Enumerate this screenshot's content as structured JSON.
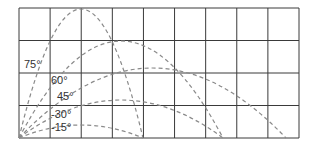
{
  "diagram": {
    "grid": {
      "x0": 19,
      "y0": 8,
      "x1": 299,
      "y1": 138,
      "cols": 9,
      "rows": 4,
      "color": "#3a3a3a"
    },
    "origin": {
      "x": 19,
      "y": 138
    },
    "trajectory_color": "#8a8a8a",
    "trajectories": [
      {
        "angle": "75°",
        "land_x": 143,
        "peak_y": 9
      },
      {
        "angle": "60°",
        "land_x": 223,
        "peak_y": 41
      },
      {
        "angle": "45°",
        "land_x": 286,
        "peak_y": 68
      },
      {
        "angle": "30°",
        "land_x": 223,
        "peak_y": 100
      },
      {
        "angle": "15°",
        "land_x": 143,
        "peak_y": 125
      }
    ],
    "labels": [
      {
        "text": "75°",
        "x": 24,
        "y": 68
      },
      {
        "text": "60°",
        "x": 51,
        "y": 84
      },
      {
        "text": "45°",
        "x": 57,
        "y": 100
      },
      {
        "text": "-30°",
        "x": 51,
        "y": 118
      },
      {
        "text": "-15°",
        "x": 51,
        "y": 131
      }
    ]
  }
}
